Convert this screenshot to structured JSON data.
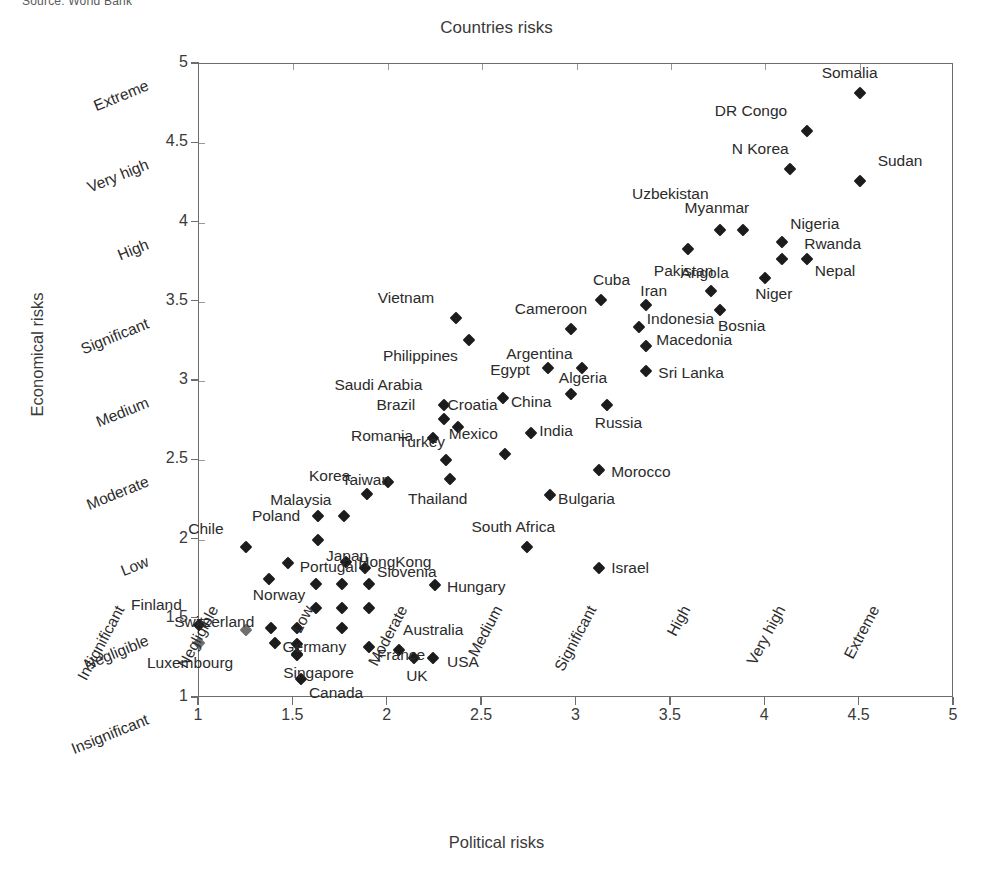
{
  "source_note": "Source: World Bank",
  "chart_data": {
    "type": "scatter",
    "title": "Countries risks",
    "xlabel": "Political risks",
    "ylabel": "Economical risks",
    "xlim": [
      1,
      5
    ],
    "ylim": [
      1,
      5
    ],
    "grid": true,
    "legend": "none",
    "x_ticks": [
      "1",
      "1.5",
      "2",
      "2.5",
      "3",
      "3.5",
      "4",
      "4.5",
      "5"
    ],
    "x_tick_values": [
      1,
      1.5,
      2,
      2.5,
      3,
      3.5,
      4,
      4.5,
      5
    ],
    "x_categories": [
      "Insignificant",
      "Negligible",
      "Low",
      "Moderate",
      "Medium",
      "Significant",
      "High",
      "Very high",
      "Extreme"
    ],
    "y_ticks": [
      "1",
      "1.5",
      "2",
      "2.5",
      "3",
      "3.5",
      "4",
      "4.5",
      "5"
    ],
    "y_tick_values": [
      1,
      1.5,
      2,
      2.5,
      3,
      3.5,
      4,
      4.5,
      5
    ],
    "y_categories": [
      "Insignificant",
      "Negligible",
      "Low",
      "Moderate",
      "Medium",
      "Significant",
      "High",
      "Very high",
      "Extreme"
    ],
    "points": [
      {
        "name": "Somalia",
        "x": 4.5,
        "y": 4.82,
        "lx": -38,
        "ly": -20,
        "anchor": "start",
        "grey": false
      },
      {
        "name": "DR Congo",
        "x": 4.22,
        "y": 4.58,
        "lx": -92,
        "ly": -20,
        "anchor": "start",
        "grey": false
      },
      {
        "name": "N Korea",
        "x": 4.13,
        "y": 4.34,
        "lx": -58,
        "ly": -20,
        "anchor": "start",
        "grey": false
      },
      {
        "name": "Sudan",
        "x": 4.5,
        "y": 4.26,
        "lx": 18,
        "ly": -20,
        "anchor": "start",
        "grey": false
      },
      {
        "name": "Myanmar",
        "x": 3.88,
        "y": 3.95,
        "lx": -58,
        "ly": -22,
        "anchor": "start",
        "grey": false
      },
      {
        "name": "Uzbekistan",
        "x": 3.76,
        "y": 3.95,
        "lx": -88,
        "ly": -36,
        "anchor": "start",
        "grey": false
      },
      {
        "name": "Nigeria",
        "x": 4.09,
        "y": 3.88,
        "lx": 8,
        "ly": -18,
        "anchor": "start",
        "grey": false
      },
      {
        "name": "Rwanda",
        "x": 4.09,
        "y": 3.77,
        "lx": 22,
        "ly": -15,
        "anchor": "start",
        "grey": false
      },
      {
        "name": "Nepal",
        "x": 4.22,
        "y": 3.77,
        "lx": 8,
        "ly": 12,
        "anchor": "start",
        "grey": false
      },
      {
        "name": "Pakistan",
        "x": 3.59,
        "y": 3.83,
        "lx": -34,
        "ly": 22,
        "anchor": "start",
        "grey": false
      },
      {
        "name": "Angola",
        "x": 3.71,
        "y": 3.57,
        "lx": -30,
        "ly": -18,
        "anchor": "start",
        "grey": false
      },
      {
        "name": "Niger",
        "x": 4.0,
        "y": 3.65,
        "lx": -10,
        "ly": 16,
        "anchor": "start",
        "grey": false
      },
      {
        "name": "Cuba",
        "x": 3.13,
        "y": 3.51,
        "lx": -8,
        "ly": -20,
        "anchor": "start",
        "grey": false
      },
      {
        "name": "Iran",
        "x": 3.37,
        "y": 3.48,
        "lx": -6,
        "ly": -14,
        "anchor": "start",
        "grey": false
      },
      {
        "name": "Bosnia",
        "x": 3.76,
        "y": 3.45,
        "lx": -2,
        "ly": 16,
        "anchor": "start",
        "grey": false
      },
      {
        "name": "Vietnam",
        "x": 2.36,
        "y": 3.4,
        "lx": -78,
        "ly": -20,
        "anchor": "start",
        "grey": false
      },
      {
        "name": "Indonesia",
        "x": 3.33,
        "y": 3.34,
        "lx": 8,
        "ly": -8,
        "anchor": "start",
        "grey": false
      },
      {
        "name": "Cameroon",
        "x": 2.97,
        "y": 3.33,
        "lx": -56,
        "ly": -20,
        "anchor": "start",
        "grey": false
      },
      {
        "name": "Philippines",
        "x": 2.43,
        "y": 3.26,
        "lx": -86,
        "ly": 16,
        "anchor": "start",
        "grey": false
      },
      {
        "name": "Macedonia",
        "x": 3.37,
        "y": 3.22,
        "lx": 10,
        "ly": -6,
        "anchor": "start",
        "grey": false
      },
      {
        "name": "Argentina",
        "x": 3.03,
        "y": 3.08,
        "lx": -76,
        "ly": -14,
        "anchor": "start",
        "grey": false
      },
      {
        "name": "Sri Lanka",
        "x": 3.37,
        "y": 3.06,
        "lx": 12,
        "ly": 2,
        "anchor": "start",
        "grey": false
      },
      {
        "name": "Egypt",
        "x": 2.85,
        "y": 3.08,
        "lx": -58,
        "ly": 2,
        "anchor": "start",
        "grey": false
      },
      {
        "name": "Algeria",
        "x": 2.97,
        "y": 2.92,
        "lx": -12,
        "ly": -16,
        "anchor": "start",
        "grey": false
      },
      {
        "name": "Saudi Arabia",
        "x": 2.3,
        "y": 2.85,
        "lx": -110,
        "ly": -20,
        "anchor": "start",
        "grey": false
      },
      {
        "name": "China",
        "x": 2.61,
        "y": 2.89,
        "lx": 8,
        "ly": 4,
        "anchor": "start",
        "grey": false
      },
      {
        "name": "Russia",
        "x": 3.16,
        "y": 2.85,
        "lx": -12,
        "ly": 18,
        "anchor": "start",
        "grey": false
      },
      {
        "name": "Brazil",
        "x": 2.3,
        "y": 2.76,
        "lx": -68,
        "ly": -14,
        "anchor": "start",
        "grey": false
      },
      {
        "name": "Croatia",
        "x": 2.37,
        "y": 2.71,
        "lx": -10,
        "ly": -22,
        "anchor": "start",
        "grey": false
      },
      {
        "name": "Romania",
        "x": 2.24,
        "y": 2.64,
        "lx": -82,
        "ly": -2,
        "anchor": "start",
        "grey": false
      },
      {
        "name": "India",
        "x": 2.76,
        "y": 2.67,
        "lx": 8,
        "ly": -2,
        "anchor": "start",
        "grey": false
      },
      {
        "name": "Mexico",
        "x": 2.62,
        "y": 2.54,
        "lx": -56,
        "ly": -20,
        "anchor": "start",
        "grey": false
      },
      {
        "name": "Turkey",
        "x": 2.31,
        "y": 2.5,
        "lx": -48,
        "ly": -18,
        "anchor": "start",
        "grey": false
      },
      {
        "name": "Morocco",
        "x": 3.12,
        "y": 2.44,
        "lx": 12,
        "ly": 2,
        "anchor": "start",
        "grey": false
      },
      {
        "name": "Taiwan",
        "x": 2.0,
        "y": 2.36,
        "lx": -46,
        "ly": -2,
        "anchor": "start",
        "grey": false
      },
      {
        "name": "Thailand",
        "x": 2.33,
        "y": 2.38,
        "lx": -42,
        "ly": 20,
        "anchor": "start",
        "grey": false
      },
      {
        "name": "Korea",
        "x": 1.89,
        "y": 2.29,
        "lx": -58,
        "ly": -18,
        "anchor": "start",
        "grey": false
      },
      {
        "name": "Bulgaria",
        "x": 2.86,
        "y": 2.28,
        "lx": 8,
        "ly": 4,
        "anchor": "start",
        "grey": false
      },
      {
        "name": "Malaysia",
        "x": 1.77,
        "y": 2.15,
        "lx": -74,
        "ly": -16,
        "anchor": "start",
        "grey": false
      },
      {
        "name": "Poland",
        "x": 1.63,
        "y": 2.15,
        "lx": -66,
        "ly": 0,
        "anchor": "start",
        "grey": false
      },
      {
        "name": "South Africa",
        "x": 2.74,
        "y": 1.95,
        "lx": -56,
        "ly": -20,
        "anchor": "start",
        "grey": false
      },
      {
        "name": "Chile",
        "x": 1.25,
        "y": 1.95,
        "lx": -58,
        "ly": -18,
        "anchor": "start",
        "grey": false
      },
      {
        "name": "Japan",
        "x": 1.63,
        "y": 2.0,
        "lx": 8,
        "ly": 16,
        "anchor": "start",
        "grey": false
      },
      {
        "name": "HongKong",
        "x": 1.78,
        "y": 1.86,
        "lx": 12,
        "ly": 0,
        "anchor": "start",
        "grey": false
      },
      {
        "name": "Slovenia",
        "x": 1.88,
        "y": 1.82,
        "lx": 12,
        "ly": 4,
        "anchor": "start",
        "grey": false
      },
      {
        "name": "Portugal",
        "x": 1.47,
        "y": 1.85,
        "lx": 12,
        "ly": 4,
        "anchor": "start",
        "grey": false
      },
      {
        "name": "Israel",
        "x": 3.12,
        "y": 1.82,
        "lx": 12,
        "ly": 0,
        "anchor": "start",
        "grey": false
      },
      {
        "name": "Norway",
        "x": 1.37,
        "y": 1.75,
        "lx": -16,
        "ly": 16,
        "anchor": "start",
        "grey": false
      },
      {
        "name": "Hungary",
        "x": 2.25,
        "y": 1.71,
        "lx": 12,
        "ly": 2,
        "anchor": "start",
        "grey": false
      },
      {
        "name": "Finland",
        "x": 1.0,
        "y": 1.46,
        "lx": -68,
        "ly": -20,
        "anchor": "start",
        "grey": false
      },
      {
        "name": "Switzerland",
        "x": 1.25,
        "y": 1.43,
        "lx": -72,
        "ly": -8,
        "anchor": "start",
        "grey": true
      },
      {
        "name": "Germany",
        "x": 1.4,
        "y": 1.35,
        "lx": 8,
        "ly": 4,
        "anchor": "start",
        "grey": false
      },
      {
        "name": "Singapore",
        "x": 1.52,
        "y": 1.27,
        "lx": -14,
        "ly": 18,
        "anchor": "start",
        "grey": false
      },
      {
        "name": "Luxembourg",
        "x": 1.0,
        "y": 1.35,
        "lx": -52,
        "ly": 20,
        "anchor": "start",
        "grey": true
      },
      {
        "name": "France",
        "x": 1.9,
        "y": 1.32,
        "lx": 8,
        "ly": 8,
        "anchor": "start",
        "grey": false
      },
      {
        "name": "Canada",
        "x": 1.54,
        "y": 1.12,
        "lx": 8,
        "ly": 14,
        "anchor": "start",
        "grey": false
      },
      {
        "name": "Australia",
        "x": 2.06,
        "y": 1.3,
        "lx": 4,
        "ly": -20,
        "anchor": "start",
        "grey": false
      },
      {
        "name": "UK",
        "x": 2.14,
        "y": 1.25,
        "lx": -8,
        "ly": 18,
        "anchor": "start",
        "grey": false
      },
      {
        "name": "USA",
        "x": 2.24,
        "y": 1.25,
        "lx": 14,
        "ly": 4,
        "anchor": "start",
        "grey": false
      },
      {
        "name": "_u1",
        "x": 1.62,
        "y": 1.72,
        "lx": 0,
        "ly": 0,
        "anchor": "none",
        "grey": false
      },
      {
        "name": "_u2",
        "x": 1.76,
        "y": 1.72,
        "lx": 0,
        "ly": 0,
        "anchor": "none",
        "grey": false
      },
      {
        "name": "_u3",
        "x": 1.9,
        "y": 1.72,
        "lx": 0,
        "ly": 0,
        "anchor": "none",
        "grey": false
      },
      {
        "name": "_u4",
        "x": 1.62,
        "y": 1.57,
        "lx": 0,
        "ly": 0,
        "anchor": "none",
        "grey": false
      },
      {
        "name": "_u5",
        "x": 1.76,
        "y": 1.57,
        "lx": 0,
        "ly": 0,
        "anchor": "none",
        "grey": false
      },
      {
        "name": "_u6",
        "x": 1.9,
        "y": 1.57,
        "lx": 0,
        "ly": 0,
        "anchor": "none",
        "grey": false
      },
      {
        "name": "_u7",
        "x": 1.52,
        "y": 1.44,
        "lx": 0,
        "ly": 0,
        "anchor": "none",
        "grey": false
      },
      {
        "name": "_u8",
        "x": 1.76,
        "y": 1.44,
        "lx": 0,
        "ly": 0,
        "anchor": "none",
        "grey": false
      },
      {
        "name": "_u9",
        "x": 1.38,
        "y": 1.44,
        "lx": 0,
        "ly": 0,
        "anchor": "none",
        "grey": false
      },
      {
        "name": "_u10",
        "x": 1.52,
        "y": 1.34,
        "lx": 0,
        "ly": 0,
        "anchor": "none",
        "grey": false
      },
      {
        "name": "_u11",
        "x": 1.52,
        "y": 1.28,
        "lx": 0,
        "ly": 0,
        "anchor": "none",
        "grey": false
      }
    ]
  }
}
